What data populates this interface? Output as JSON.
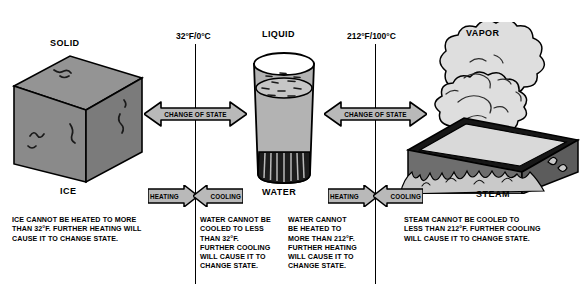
{
  "diagram": {
    "colors": {
      "ice_fill": "#8a8a8a",
      "ice_top": "#9a9a9a",
      "ice_side": "#7a7a7a",
      "water_fill": "#b3b3b3",
      "glass_base": "#1c1c1c",
      "pan_fill": "#6e6e6e",
      "pan_rim": "#171717",
      "vapor_fill": "#dedede",
      "arrow_fill": "#b9b9b9",
      "stroke": "#000000",
      "background": "#ffffff"
    },
    "states": [
      {
        "id": "solid",
        "label": "SOLID",
        "object_label": "ICE"
      },
      {
        "id": "liquid",
        "label": "LIQUID",
        "object_label": "WATER"
      },
      {
        "id": "vapor",
        "label": "VAPOR",
        "object_label": "STEAM"
      }
    ],
    "temperatures": [
      {
        "id": "freezing",
        "label": "32°F/0°C"
      },
      {
        "id": "boiling",
        "label": "212°F/100°C"
      }
    ],
    "change_of_state": [
      {
        "id": "fusion",
        "label": "CHANGE OF STATE"
      },
      {
        "id": "vaporization",
        "label": "CHANGE OF STATE"
      }
    ],
    "process_arrows": [
      {
        "id": "heating-left",
        "label": "HEATING",
        "direction": "right"
      },
      {
        "id": "cooling-left",
        "label": "COOLING",
        "direction": "left"
      },
      {
        "id": "heating-right",
        "label": "HEATING",
        "direction": "right"
      },
      {
        "id": "cooling-right",
        "label": "COOLING",
        "direction": "left"
      }
    ],
    "notes": [
      {
        "id": "ice-note",
        "lines": [
          "ICE CANNOT BE HEATED TO MORE",
          "THAN 32°F. FURTHER HEATING WILL",
          "CAUSE IT TO CHANGE STATE."
        ]
      },
      {
        "id": "water-cooling-note",
        "lines": [
          "WATER CANNOT BE",
          "COOLED TO LESS",
          "THAN 32°F.",
          "FURTHER COOLING",
          "WILL CAUSE IT TO",
          "CHANGE STATE."
        ]
      },
      {
        "id": "water-heating-note",
        "lines": [
          "WATER CANNOT",
          "BE HEATED TO",
          "MORE THAN 212°F.",
          "FURTHER HEATING",
          "WILL CAUSE IT TO",
          "CHANGE STATE."
        ]
      },
      {
        "id": "steam-note",
        "lines": [
          "STEAM CANNOT BE COOLED TO",
          "LESS THAN 212°F. FURTHER COOLING",
          "WILL CAUSE IT TO CHANGE STATE."
        ]
      }
    ]
  }
}
